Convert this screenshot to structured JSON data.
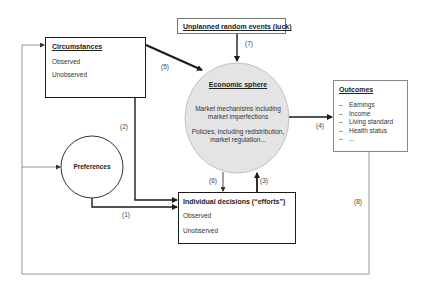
{
  "diagram": {
    "nodes": {
      "circumstances": {
        "title": "Circumstances",
        "items": [
          "Observed",
          "Unobserved"
        ]
      },
      "luck": {
        "title": "Unplanned random events (luck)"
      },
      "economic_sphere": {
        "title": "Economic sphere",
        "line1a": "Market mechanisms including",
        "line1b": "market imperfections",
        "line2a": "Policies, including redistribution,",
        "line2b": "market regulation..."
      },
      "outcomes": {
        "title": "Outcomes",
        "items": [
          "Earnings",
          "Income",
          "Living standard",
          "Health status",
          "..."
        ],
        "bullet": "–"
      },
      "preferences": {
        "title": "Preferences"
      },
      "decisions": {
        "title": "Individual decisions (“efforts”)",
        "items": [
          "Observed",
          "Unobserved"
        ]
      }
    },
    "edges": [
      {
        "id": "1",
        "label": "(1)",
        "from": "Preferences",
        "to": "Individual decisions"
      },
      {
        "id": "2",
        "label": "(2)",
        "from": "Circumstances",
        "to": "Individual decisions"
      },
      {
        "id": "3",
        "label": "(3)",
        "from": "Individual decisions",
        "to": "Economic sphere"
      },
      {
        "id": "4",
        "label": "(4)",
        "from": "Economic sphere",
        "to": "Outcomes"
      },
      {
        "id": "5",
        "label": "(5)",
        "from": "Circumstances",
        "to": "Economic sphere"
      },
      {
        "id": "6",
        "label": "(6)",
        "from": "Economic sphere",
        "to": "Individual decisions"
      },
      {
        "id": "7",
        "label": "(7)",
        "from": "Unplanned random events",
        "to": "Economic sphere"
      },
      {
        "id": "8",
        "label": "(8)",
        "from": "Outcomes",
        "to": "Circumstances / Preferences"
      }
    ],
    "colors": {
      "ellipse_fill": "#e4e4e4",
      "ellipse_stroke": "#b8b8b8",
      "stroke": "#1a1a1a",
      "thin_stroke": "#888888"
    }
  }
}
